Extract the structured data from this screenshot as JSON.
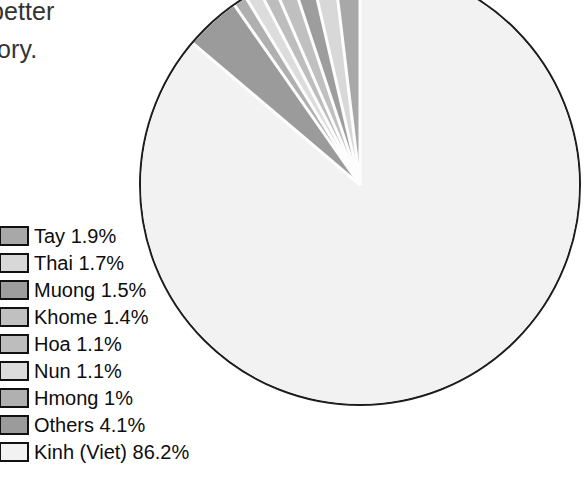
{
  "page": {
    "background_color": "#ffffff",
    "cutoff_text_lines": [
      "better",
      "tory."
    ]
  },
  "chart_data": {
    "type": "pie",
    "title": "",
    "xlabel": "",
    "ylabel": "",
    "legend_position": "bottom-left",
    "grid": false,
    "start_angle_deg": 0,
    "direction": "counter-clockwise",
    "categories": [
      "Tay",
      "Thai",
      "Muong",
      "Khome",
      "Hoa",
      "Nun",
      "Hmong",
      "Others",
      "Kinh (Viet)"
    ],
    "values": [
      1.9,
      1.7,
      1.5,
      1.4,
      1.1,
      1.1,
      1.0,
      4.1,
      86.2
    ],
    "value_suffix": "%",
    "slices": [
      {
        "label": "Tay",
        "value": 1.9,
        "display": "Tay 1.9%",
        "color": "#a8a8a8"
      },
      {
        "label": "Thai",
        "value": 1.7,
        "display": "Thai 1.7%",
        "color": "#d8d8d8"
      },
      {
        "label": "Muong",
        "value": 1.5,
        "display": "Muong 1.5%",
        "color": "#9d9d9d"
      },
      {
        "label": "Khome",
        "value": 1.4,
        "display": "Khome 1.4%",
        "color": "#c0c0c0"
      },
      {
        "label": "Hoa",
        "value": 1.1,
        "display": "Hoa 1.1%",
        "color": "#bdbdbd"
      },
      {
        "label": "Nun",
        "value": 1.1,
        "display": "Nun 1.1%",
        "color": "#dcdcdc"
      },
      {
        "label": "Hmong",
        "value": 1.0,
        "display": "Hmong 1%",
        "color": "#b0b0b0"
      },
      {
        "label": "Others",
        "value": 4.1,
        "display": "Others 4.1%",
        "color": "#9b9b9b"
      },
      {
        "label": "Kinh (Viet)",
        "value": 86.2,
        "display": "Kinh (Viet) 86.2%",
        "color": "#f2f2f2"
      }
    ],
    "outline_color": "#1d1d1d",
    "separator_color": "#fdfdfd"
  }
}
